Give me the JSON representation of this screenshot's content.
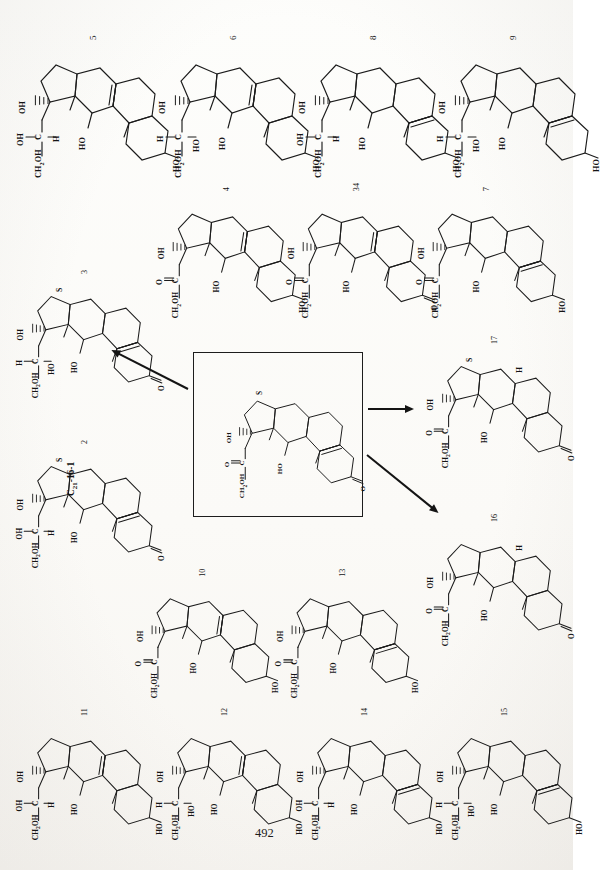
{
  "document": {
    "kind": "scanned-journal-page",
    "orientation": "rotated-90-ccw",
    "page_number": "492",
    "background_hex": "#fbfaf8",
    "ink_hex": "#1b1b1b"
  },
  "scheme": {
    "title_code": "C21-16-1",
    "center_box": {
      "code_label": "C",
      "code_sub": "21",
      "code_rest": "-16-1",
      "stereo_label": "S",
      "substituents": [
        "CH2OH",
        "C=O",
        "OH",
        "HO",
        "O"
      ]
    },
    "arrows": [
      {
        "name": "arrow-to-3",
        "from": "center-box",
        "to": "3"
      },
      {
        "name": "arrow-to-17",
        "from": "center-box",
        "to": "17"
      },
      {
        "name": "arrow-to-16",
        "from": "center-box",
        "to": "16"
      }
    ]
  },
  "labels": {
    "ch2oh": "CH",
    "ch2oh_sub": "2",
    "ch2oh_rest": "OH",
    "oh": "OH",
    "ho": "HO",
    "h": "H",
    "c": "C",
    "o": "O",
    "co": "C",
    "stereo_s": "S"
  },
  "structures": [
    {
      "id": "5",
      "number": "5",
      "stereo": "",
      "sidechain": [
        "CH2OH",
        "OH",
        "H",
        "OH"
      ],
      "ring_a": "3-OH",
      "d_bond": "delta-5",
      "row": "top",
      "col": 1
    },
    {
      "id": "6",
      "number": "6",
      "stereo": "",
      "sidechain": [
        "CH2OH",
        "H",
        "HO",
        "OH"
      ],
      "ring_a": "3-OH",
      "d_bond": "delta-5",
      "row": "top",
      "col": 2
    },
    {
      "id": "8",
      "number": "8",
      "stereo": "",
      "sidechain": [
        "CH2OH",
        "OH",
        "H",
        "OH"
      ],
      "ring_a": "3-OH",
      "d_bond": "delta-4",
      "row": "top",
      "col": 3
    },
    {
      "id": "9",
      "number": "9",
      "stereo": "",
      "sidechain": [
        "CH2OH",
        "H",
        "HO",
        "OH"
      ],
      "ring_a": "3-OH",
      "d_bond": "delta-4",
      "row": "top",
      "col": 4
    },
    {
      "id": "4",
      "number": "4",
      "stereo": "",
      "sidechain": [
        "CH2OH",
        "C=O",
        "OH"
      ],
      "ring_a": "3-OH",
      "d_bond": "delta-5",
      "row": "second",
      "col": 2
    },
    {
      "id": "34",
      "number": "34",
      "stereo": "",
      "sidechain": [
        "CH2OH",
        "C=O",
        "OH"
      ],
      "ring_a": "3-one",
      "d_bond": "delta-5",
      "row": "second",
      "col": 3
    },
    {
      "id": "7",
      "number": "7",
      "stereo": "",
      "sidechain": [
        "CH2OH",
        "C=O",
        "OH"
      ],
      "ring_a": "3-OH",
      "d_bond": "delta-4",
      "row": "second",
      "col": 4
    },
    {
      "id": "3",
      "number": "3",
      "stereo": "S",
      "sidechain": [
        "CH2OH",
        "H",
        "HO",
        "OH"
      ],
      "ring_a": "3-one",
      "d_bond": "delta-4",
      "row": "left",
      "col": 1
    },
    {
      "id": "2",
      "number": "2",
      "stereo": "S",
      "sidechain": [
        "CH2OH",
        "OH",
        "H",
        "OH"
      ],
      "ring_a": "3-one",
      "d_bond": "delta-4",
      "row": "left",
      "col": 1
    },
    {
      "id": "17",
      "number": "17",
      "stereo": "S",
      "sidechain": [
        "CH2OH",
        "C=O",
        "OH"
      ],
      "ring_a": "3-one",
      "d_bond": "5-H",
      "row": "right",
      "col": 5
    },
    {
      "id": "16",
      "number": "16",
      "stereo": "",
      "sidechain": [
        "CH2OH",
        "C=O",
        "OH"
      ],
      "ring_a": "3-one",
      "d_bond": "5-H",
      "row": "right",
      "col": 5
    },
    {
      "id": "10",
      "number": "10",
      "stereo": "",
      "sidechain": [
        "CH2OH",
        "C=O",
        "OH"
      ],
      "ring_a": "3-OH",
      "d_bond": "delta-5",
      "row": "third",
      "col": 2
    },
    {
      "id": "13",
      "number": "13",
      "stereo": "",
      "sidechain": [
        "CH2OH",
        "C=O",
        "OH"
      ],
      "ring_a": "3-OH",
      "d_bond": "delta-4",
      "row": "third",
      "col": 3
    },
    {
      "id": "11",
      "number": "11",
      "stereo": "",
      "sidechain": [
        "CH2OH",
        "OH",
        "H",
        "OH"
      ],
      "ring_a": "3-OH",
      "d_bond": "delta-5",
      "row": "bottom",
      "col": 1
    },
    {
      "id": "12",
      "number": "12",
      "stereo": "",
      "sidechain": [
        "CH2OH",
        "H",
        "HO",
        "OH"
      ],
      "ring_a": "3-OH",
      "d_bond": "delta-5",
      "row": "bottom",
      "col": 2
    },
    {
      "id": "14",
      "number": "14",
      "stereo": "",
      "sidechain": [
        "CH2OH",
        "OH",
        "H",
        "OH"
      ],
      "ring_a": "3-OH",
      "d_bond": "delta-4",
      "row": "bottom",
      "col": 3
    },
    {
      "id": "15",
      "number": "15",
      "stereo": "",
      "sidechain": [
        "CH2OH",
        "H",
        "HO",
        "OH"
      ],
      "ring_a": "3-OH",
      "d_bond": "delta-4",
      "row": "bottom",
      "col": 4
    }
  ]
}
